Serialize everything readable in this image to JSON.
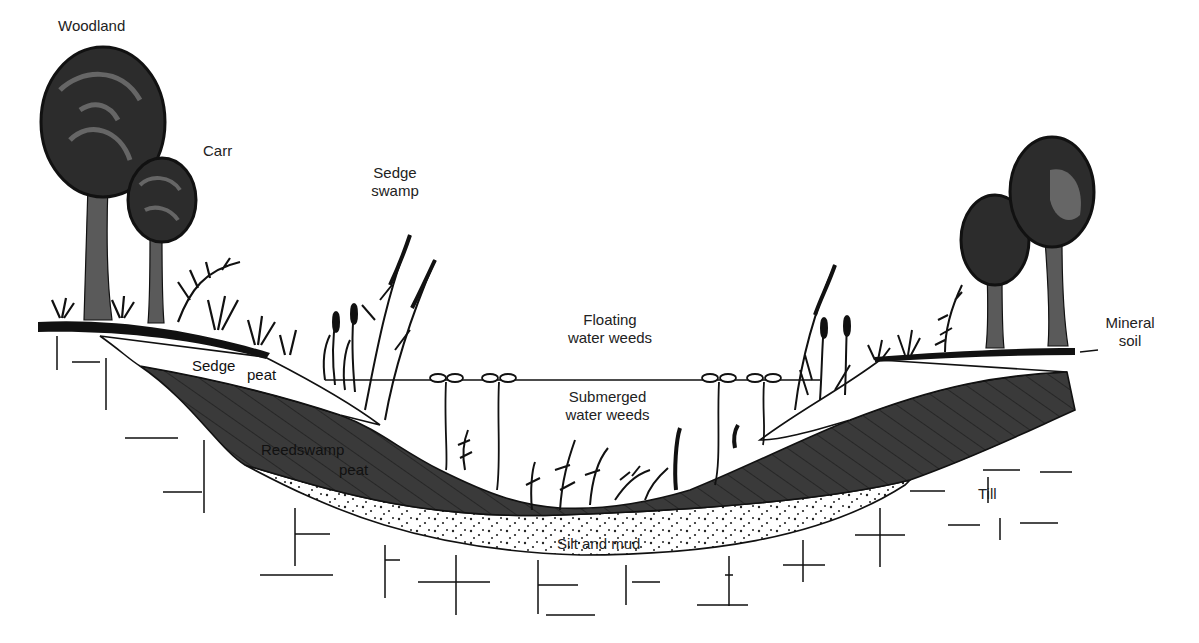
{
  "diagram": {
    "colors": {
      "background": "#ffffff",
      "line": "#111111",
      "peat_fill": "#3a3a3a",
      "tree_canopy": "#2c2c2c",
      "tree_canopy_highlight": "#555555",
      "tree_trunk": "#5a5a5a",
      "ground": "#111111"
    },
    "labels": {
      "woodland": "Woodland",
      "carr": "Carr",
      "sedge_swamp_line1": "Sedge",
      "sedge_swamp_line2": "swamp",
      "floating_line1": "Floating",
      "floating_line2": "water weeds",
      "submerged_line1": "Submerged",
      "submerged_line2": "water weeds",
      "sedge_peat_a": "Sedge",
      "sedge_peat_b": "peat",
      "reedswamp_line1": "Reedswamp",
      "reedswamp_line2": "peat",
      "silt_mud": "Silt and mud",
      "mineral_line1": "Mineral",
      "mineral_line2": "soil",
      "till": "Till"
    },
    "zones": [
      {
        "name": "Woodland",
        "type": "vegetation"
      },
      {
        "name": "Carr",
        "type": "vegetation"
      },
      {
        "name": "Sedge swamp",
        "type": "vegetation"
      },
      {
        "name": "Floating water weeds",
        "type": "vegetation"
      },
      {
        "name": "Submerged water weeds",
        "type": "vegetation"
      },
      {
        "name": "Sedge peat",
        "type": "sediment"
      },
      {
        "name": "Reedswamp peat",
        "type": "sediment"
      },
      {
        "name": "Silt and mud",
        "type": "sediment"
      },
      {
        "name": "Mineral soil",
        "type": "substrate"
      },
      {
        "name": "Till",
        "type": "substrate"
      }
    ]
  }
}
